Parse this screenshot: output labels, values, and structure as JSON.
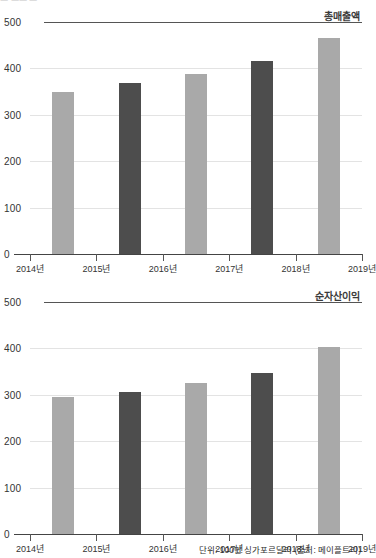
{
  "artifact": {
    "clipped_text": "ㅡ  ㅡㅡ ㅡ"
  },
  "footnote": "단위: 100만 싱가포르달러 (출처: 메이플트리)",
  "colors": {
    "bar_light": "#a9a9a9",
    "bar_dark": "#4d4d4d",
    "gridline": "#e3e3e3",
    "axis": "#444444"
  },
  "charts": [
    {
      "series_label": "총매출액",
      "y_ticks": [
        "500",
        "400",
        "300",
        "200",
        "100",
        "0"
      ],
      "x_ticks": [
        "2014년",
        "2015년",
        "2016년",
        "2017년",
        "2018년",
        "2019년"
      ]
    },
    {
      "series_label": "순자산이익",
      "y_ticks": [
        "500",
        "400",
        "300",
        "200",
        "100",
        "0"
      ],
      "x_ticks": [
        "2014년",
        "2015년",
        "2016년",
        "2017년",
        "2018년",
        "2019년"
      ]
    }
  ],
  "chart_data": [
    {
      "type": "bar",
      "title": "총매출액",
      "xlabel": "",
      "ylabel": "",
      "ylim": [
        0,
        500
      ],
      "yticks": [
        0,
        100,
        200,
        300,
        400,
        500
      ],
      "grid": true,
      "legend": "none",
      "unit": "100만 싱가포르달러",
      "source": "메이플트리",
      "categories": [
        "2014년",
        "2015년",
        "2016년",
        "2017년",
        "2018년",
        "2019년"
      ],
      "bar_categories": [
        "2014년",
        "2015년",
        "2016년",
        "2017년",
        "2018년"
      ],
      "values": [
        350,
        368,
        387,
        415,
        465
      ],
      "bar_colors": [
        "light",
        "dark",
        "light",
        "dark",
        "light"
      ]
    },
    {
      "type": "bar",
      "title": "순자산이익",
      "xlabel": "",
      "ylabel": "",
      "ylim": [
        0,
        500
      ],
      "yticks": [
        0,
        100,
        200,
        300,
        400,
        500
      ],
      "grid": true,
      "legend": "none",
      "unit": "100만 싱가포르달러",
      "source": "메이플트리",
      "categories": [
        "2014년",
        "2015년",
        "2016년",
        "2017년",
        "2018년",
        "2019년"
      ],
      "bar_categories": [
        "2014년",
        "2015년",
        "2016년",
        "2017년",
        "2018년"
      ],
      "values": [
        295,
        307,
        325,
        348,
        402
      ],
      "bar_colors": [
        "light",
        "dark",
        "light",
        "dark",
        "light"
      ]
    }
  ]
}
